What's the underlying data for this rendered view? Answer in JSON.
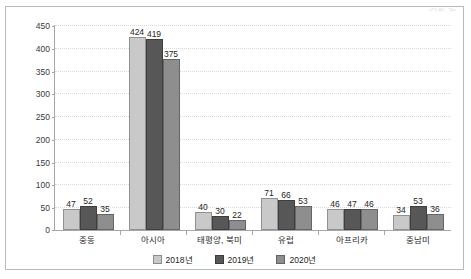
{
  "header": {
    "note": "(단위: 건)"
  },
  "legend": {
    "position": "bottom-center",
    "items": [
      {
        "label": "2018년",
        "color": "#c9c9c9"
      },
      {
        "label": "2019년",
        "color": "#575757"
      },
      {
        "label": "2020년",
        "color": "#8e8e8e"
      }
    ]
  },
  "yaxis": {
    "ticks": [
      "0",
      "50",
      "100",
      "150",
      "200",
      "250",
      "300",
      "350",
      "400",
      "450"
    ]
  },
  "chart_data": {
    "type": "bar",
    "title": "",
    "xlabel": "",
    "ylabel": "",
    "ylim": [
      0,
      450
    ],
    "ytick_step": 50,
    "grid": true,
    "legend_position": "bottom-center",
    "categories": [
      "중동",
      "아시아",
      "태평양, 북미",
      "유럽",
      "아프리카",
      "중남미"
    ],
    "series": [
      {
        "name": "2018년",
        "color": "#c9c9c9",
        "values": [
          47,
          424,
          40,
          71,
          46,
          34
        ]
      },
      {
        "name": "2019년",
        "color": "#575757",
        "values": [
          52,
          419,
          30,
          66,
          47,
          53
        ]
      },
      {
        "name": "2020년",
        "color": "#8e8e8e",
        "values": [
          35,
          375,
          22,
          53,
          46,
          36
        ]
      }
    ]
  }
}
